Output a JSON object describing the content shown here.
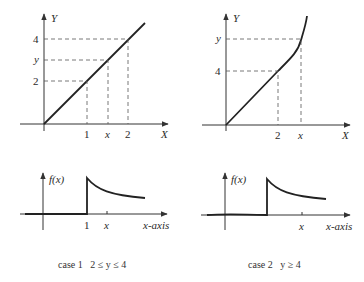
{
  "panels": {
    "case1_transform": {
      "y_axis_label": "Y",
      "x_axis_label": "X",
      "y_ticks": [
        "4",
        "y",
        "2"
      ],
      "x_ticks": [
        "1",
        "x",
        "2"
      ]
    },
    "case2_transform": {
      "y_axis_label": "Y",
      "x_axis_label": "X",
      "y_ticks": [
        "y",
        "4"
      ],
      "x_ticks": [
        "2",
        "x"
      ]
    },
    "case1_density": {
      "y_axis_label": "f(x)",
      "x_axis_label": "x-axis",
      "x_ticks": [
        "1",
        "x"
      ]
    },
    "case2_density": {
      "y_axis_label": "f(x)",
      "x_axis_label": "x-axis",
      "x_ticks": [
        "x"
      ]
    }
  },
  "captions": {
    "case1": "case 1   2 ≤ y ≤ 4",
    "case2": "case 2   y ≥ 4"
  }
}
